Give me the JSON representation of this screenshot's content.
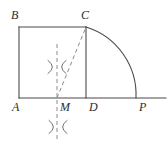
{
  "figure": {
    "canvas": {
      "width": 168,
      "height": 145
    },
    "colors": {
      "stroke": "#4a4a4a",
      "dashed_stroke": "#8c8c8c",
      "label": "#2b2b2b",
      "background": "#ffffff"
    },
    "points": {
      "A": {
        "x": 19,
        "y": 98
      },
      "B": {
        "x": 19,
        "y": 27
      },
      "C": {
        "x": 86,
        "y": 27
      },
      "D": {
        "x": 86,
        "y": 98
      },
      "M": {
        "x": 57,
        "y": 98
      },
      "P": {
        "x": 136,
        "y": 98
      }
    },
    "labels": [
      {
        "id": "B",
        "text": "B",
        "x": 11,
        "y": 9
      },
      {
        "id": "C",
        "text": "C",
        "x": 81,
        "y": 9
      },
      {
        "id": "A",
        "text": "A",
        "x": 12,
        "y": 101
      },
      {
        "id": "M",
        "text": "M",
        "x": 60,
        "y": 101
      },
      {
        "id": "D",
        "text": "D",
        "x": 89,
        "y": 101
      },
      {
        "id": "P",
        "text": "P",
        "x": 139,
        "y": 101
      }
    ],
    "segments": [
      {
        "id": "baseline",
        "name": "baseline-AP-extended",
        "x1": 19,
        "y1": 98,
        "x2": 166,
        "y2": 98,
        "style": "solid"
      },
      {
        "id": "AB",
        "name": "segment-AB",
        "x1": 19,
        "y1": 98,
        "x2": 19,
        "y2": 27,
        "style": "solid"
      },
      {
        "id": "BC",
        "name": "segment-BC",
        "x1": 19,
        "y1": 27,
        "x2": 86,
        "y2": 27,
        "style": "solid"
      },
      {
        "id": "CD",
        "name": "segment-CD",
        "x1": 86,
        "y1": 27,
        "x2": 86,
        "y2": 98,
        "style": "solid"
      },
      {
        "id": "MC",
        "name": "segment-MC",
        "x1": 57,
        "y1": 98,
        "x2": 86,
        "y2": 27,
        "style": "dashed"
      },
      {
        "id": "bisector",
        "name": "perpendicular-bisector-through-M",
        "x1": 57,
        "y1": 44,
        "x2": 57,
        "y2": 139,
        "style": "dashed"
      }
    ],
    "arcs": [
      {
        "id": "CP",
        "name": "arc-C-to-P",
        "start": {
          "x": 86,
          "y": 27
        },
        "end": {
          "x": 136,
          "y": 98
        },
        "center": {
          "x": 86,
          "y": 98
        },
        "radius": 71,
        "style": "solid"
      }
    ],
    "construction_marks": [
      {
        "id": "mark-upper",
        "name": "compass-arc-intersection-upper",
        "x": 57,
        "y": 67
      },
      {
        "id": "mark-lower",
        "name": "compass-arc-intersection-lower",
        "x": 58,
        "y": 127
      }
    ]
  }
}
